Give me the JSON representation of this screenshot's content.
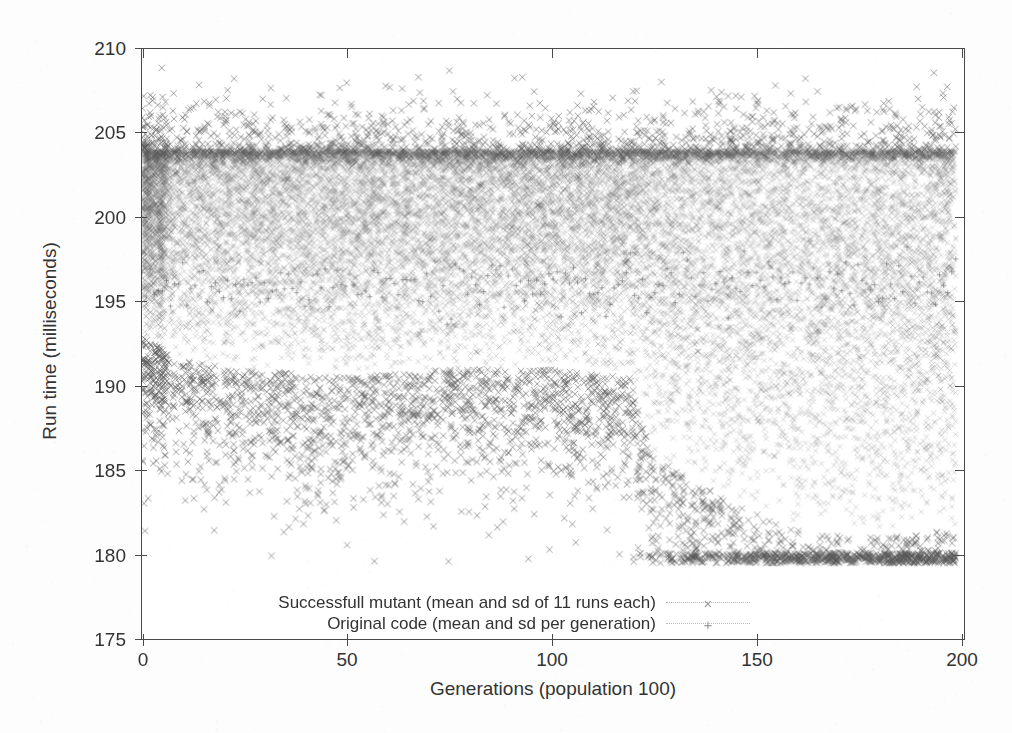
{
  "figure": {
    "background_color": "#fdfdfd",
    "axis_color": "#4a4a4a",
    "text_color": "#333333",
    "marker_color": "#555555",
    "legend_marker_color": "#9a9a9a"
  },
  "axes": {
    "y_title": "Run time (milliseconds)",
    "x_title": "Generations (population 100)",
    "y_ticks": [
      "175",
      "180",
      "185",
      "190",
      "195",
      "200",
      "205",
      "210"
    ],
    "x_ticks": [
      "0",
      "50",
      "100",
      "150",
      "200"
    ]
  },
  "legend": {
    "entries": [
      {
        "label": "Successfull mutant (mean and sd of 11 runs each)",
        "marker": "cross-x-icon",
        "glyph": "×"
      },
      {
        "label": "Original code (mean and sd per generation)",
        "marker": "plus-icon",
        "glyph": "+"
      }
    ]
  },
  "chart_data": {
    "type": "scatter",
    "title": "",
    "xlabel": "Generations (population 100)",
    "ylabel": "Run time (milliseconds)",
    "xlim": [
      0,
      202
    ],
    "ylim": [
      175,
      210
    ],
    "xticks": [
      0,
      50,
      100,
      150,
      200
    ],
    "yticks": [
      175,
      180,
      185,
      190,
      195,
      200,
      205,
      210
    ],
    "grid": false,
    "legend_position": "bottom-center",
    "series": [
      {
        "name": "Successfull mutant (mean and sd of 11 runs each)",
        "marker": "x",
        "color": "#555555",
        "point_count_approx": 20000,
        "description": "Dense cloud of per-mutant mean run times across 200 generations; sharp upper density cutoff at about 204 ms, bulk spanning roughly 192-204 ms, with scattered outliers up to about 209.5 ms and a lower tail that drops sharply after generation 120 reaching about 179.5 ms.",
        "density_profile": {
          "upper_cutoff_ms": 204,
          "bulk_top_ms": 203.8,
          "bulk_bottom_by_generation": [
            {
              "generation": 0,
              "ms": 193.0
            },
            {
              "generation": 10,
              "ms": 191.5
            },
            {
              "generation": 25,
              "ms": 191.0
            },
            {
              "generation": 50,
              "ms": 190.5
            },
            {
              "generation": 75,
              "ms": 191.0
            },
            {
              "generation": 100,
              "ms": 191.0
            },
            {
              "generation": 120,
              "ms": 190.5
            },
            {
              "generation": 125,
              "ms": 186.0
            },
            {
              "generation": 145,
              "ms": 183.0
            },
            {
              "generation": 160,
              "ms": 181.5
            },
            {
              "generation": 175,
              "ms": 181.0
            },
            {
              "generation": 200,
              "ms": 181.5
            }
          ],
          "outlier_max_ms": 209.6,
          "outlier_min_ms": 179.5
        }
      },
      {
        "name": "Original code (mean and sd per generation)",
        "marker": "+",
        "color": "#555555",
        "point_count_approx": 200,
        "description": "Baseline original-code mean per generation, overlaid within the dense cloud near 195-198 ms.",
        "mean_ms_approx": 196.0
      }
    ]
  }
}
